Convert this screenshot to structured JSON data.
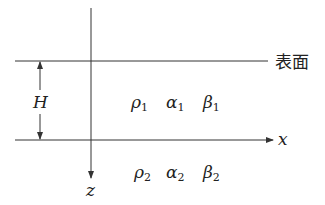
{
  "diagram": {
    "surface_label": "表面",
    "thickness_label": "H",
    "x_axis_label": "x",
    "z_axis_label": "z",
    "layer1": {
      "rho": "ρ",
      "rho_sub": "1",
      "alpha": "α",
      "alpha_sub": "1",
      "beta": "β",
      "beta_sub": "1"
    },
    "layer2": {
      "rho": "ρ",
      "rho_sub": "2",
      "alpha": "α",
      "alpha_sub": "2",
      "beta": "β",
      "beta_sub": "2"
    },
    "line_color": "#333333"
  }
}
